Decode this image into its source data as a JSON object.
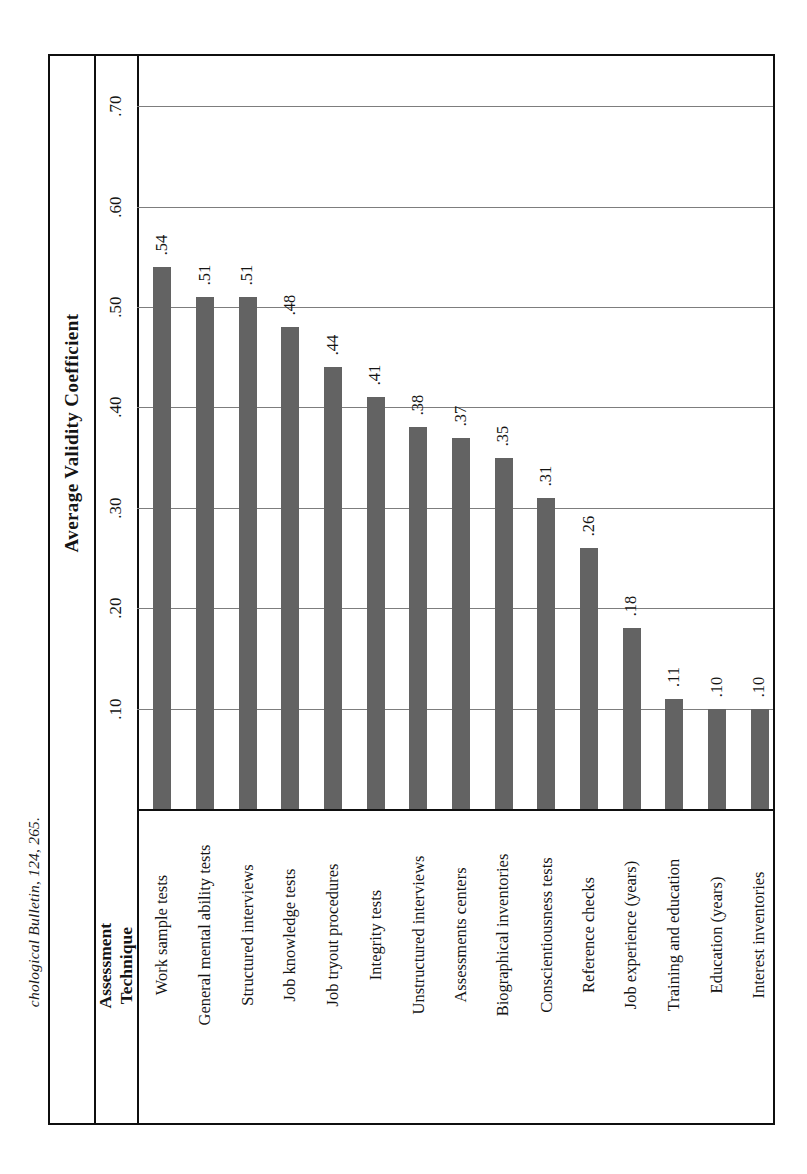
{
  "caption": "chological Bulletin, 124, 265.",
  "axis_title": "Average Validity Coefficient",
  "category_header_line1": "Assessment",
  "category_header_line2": "Technique",
  "colors": {
    "bar": "#636363",
    "frame": "#0f0f0f",
    "gridline": "#7d7d7d",
    "background": "#ffffff"
  },
  "chart_data": {
    "type": "bar",
    "title": "",
    "xlabel": "Assessment Technique",
    "ylabel": "Average Validity Coefficient",
    "ylim": [
      0,
      0.75
    ],
    "grid": true,
    "legend": "none",
    "orientation": "vertical-rotated",
    "tick_labels": [
      ".10",
      ".20",
      ".30",
      ".40",
      ".50",
      ".60",
      ".70"
    ],
    "ticks": [
      0.1,
      0.2,
      0.3,
      0.4,
      0.5,
      0.6,
      0.7
    ],
    "categories": [
      "Work sample tests",
      "General mental ability tests",
      "Structured interviews",
      "Job knowledge tests",
      "Job tryout procedures",
      "Integrity tests",
      "Unstructured interviews",
      "Assessments centers",
      "Biographical inventories",
      "Conscientiousness tests",
      "Reference checks",
      "Job experience (years)",
      "Training and education",
      "Education (years)",
      "Interest inventories"
    ],
    "values": [
      0.54,
      0.51,
      0.51,
      0.48,
      0.44,
      0.41,
      0.38,
      0.37,
      0.35,
      0.31,
      0.26,
      0.18,
      0.11,
      0.1,
      0.1
    ],
    "value_labels": [
      ".54",
      ".51",
      ".51",
      ".48",
      ".44",
      ".41",
      ".38",
      ".37",
      ".35",
      ".31",
      ".26",
      ".18",
      ".11",
      ".10",
      ".10"
    ]
  }
}
